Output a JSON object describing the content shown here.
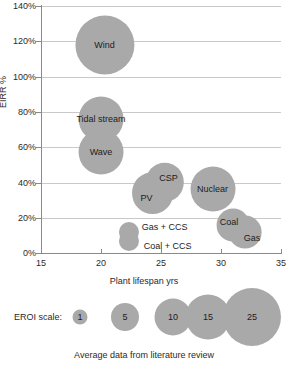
{
  "chart_data": {
    "type": "scatter",
    "title": "",
    "subtitle": "",
    "xlabel": "Plant lifespan yrs",
    "ylabel": "EIRR %",
    "xlim": [
      15,
      35
    ],
    "ylim": [
      0,
      140
    ],
    "xticks": [
      "15",
      "20",
      "25",
      "30",
      "35"
    ],
    "yticks": [
      "0%",
      "20%",
      "40%",
      "60%",
      "80%",
      "100%",
      "120%",
      "140%"
    ],
    "grid": true,
    "legend_position": "bottom",
    "caption": "Average data from literature review",
    "size_encoding": "EROI",
    "points": [
      {
        "label": "Wind",
        "x": 20.3,
        "y": 118,
        "size": 26
      },
      {
        "label": "Tidal stream",
        "x": 20.0,
        "y": 76,
        "size": 15
      },
      {
        "label": "Wave",
        "x": 20.0,
        "y": 57,
        "size": 15
      },
      {
        "label": "CSP",
        "x": 25.3,
        "y": 40,
        "size": 11
      },
      {
        "label": "PV",
        "x": 24.3,
        "y": 34,
        "size": 13
      },
      {
        "label": "Nuclear",
        "x": 29.3,
        "y": 36,
        "size": 15
      },
      {
        "label": "Coal",
        "x": 31.0,
        "y": 16,
        "size": 8
      },
      {
        "label": "Gas",
        "x": 32.0,
        "y": 12,
        "size": 8
      },
      {
        "label": "Gas + CCS",
        "x": 22.3,
        "y": 12,
        "size": 3
      },
      {
        "label": "Coal + CCS",
        "x": 22.3,
        "y": 7,
        "size": 3
      }
    ],
    "legend": {
      "title": "EROI scale:",
      "entries": [
        {
          "label": "1",
          "diameter_px": 15
        },
        {
          "label": "5",
          "diameter_px": 28
        },
        {
          "label": "10",
          "diameter_px": 37
        },
        {
          "label": "15",
          "diameter_px": 45
        },
        {
          "label": "25",
          "diameter_px": 58
        }
      ]
    },
    "colors": {
      "bubble_fill": "#a9a9a9",
      "gridline": "#c9c9c9",
      "axis": "#8a8a8a",
      "text": "#2a2a2a"
    }
  }
}
